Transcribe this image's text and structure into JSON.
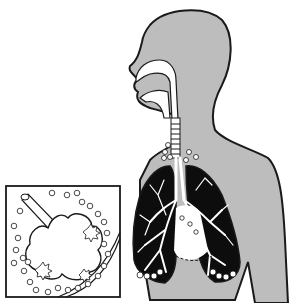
{
  "diagram": {
    "parts": [
      {
        "id": "head-torso",
        "label": "head and upper body silhouette"
      },
      {
        "id": "nasal-oral-cavity",
        "label": "nasal and oral airway"
      },
      {
        "id": "trachea",
        "label": "trachea"
      },
      {
        "id": "lungs",
        "label": "lungs with bronchial tree"
      },
      {
        "id": "heart-space",
        "label": "heart region (dashed diaphragm line)"
      },
      {
        "id": "lymph-nodes",
        "label": "circles representing particles / nodes"
      },
      {
        "id": "inset",
        "label": "magnified alveolus inset"
      }
    ],
    "colors": {
      "skin": "#bdbdbd",
      "outline": "#1a1a1a",
      "lung": "#0d0d0d",
      "airway": "#ffffff",
      "background": "#ffffff"
    }
  }
}
